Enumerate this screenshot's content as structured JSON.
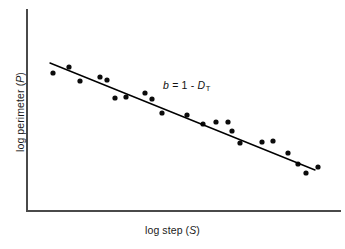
{
  "figure": {
    "background_color": "#ffffff",
    "axis_color": "#4a4a4a",
    "line_color": "#000000",
    "point_color": "#0c0c0c"
  },
  "labels": {
    "xaxis_prefix": "log step (",
    "xaxis_var": "S",
    "xaxis_suffix": ")",
    "yaxis_prefix": "log perimeter (",
    "yaxis_var": "P",
    "yaxis_suffix": ")",
    "annotation_var_b": "b",
    "annotation_eq": " = 1 - ",
    "annotation_var_d": "D",
    "annotation_sub": "T"
  },
  "chart_data": {
    "type": "scatter",
    "title": "",
    "xlabel": "log step (S)",
    "ylabel": "log perimeter (P)",
    "grid": false,
    "legend": false,
    "axis_ticks": [],
    "annotations": [
      {
        "text": "b = 1 - D_T",
        "x_px": 163,
        "y_px": 79,
        "meaning": "slope b equals one minus the topothesy/divider fractal dimension D sub T"
      }
    ],
    "axis_range_px": {
      "x_left": 27,
      "x_right": 340,
      "y_top": 10,
      "y_bottom": 211
    },
    "x": [
      53,
      69,
      80,
      100,
      107,
      115,
      126,
      145,
      152,
      162,
      187,
      203,
      216,
      228,
      232,
      240,
      262,
      273,
      288,
      298,
      306,
      318
    ],
    "y": [
      73,
      67,
      81,
      77,
      80,
      98,
      97,
      93,
      99,
      113,
      115,
      124,
      122,
      122,
      131,
      143,
      142,
      141,
      153,
      164,
      173,
      167
    ],
    "points": [
      {
        "x": 53,
        "y": 73
      },
      {
        "x": 69,
        "y": 67
      },
      {
        "x": 80,
        "y": 81
      },
      {
        "x": 100,
        "y": 77
      },
      {
        "x": 107,
        "y": 80
      },
      {
        "x": 115,
        "y": 98
      },
      {
        "x": 126,
        "y": 97
      },
      {
        "x": 145,
        "y": 93
      },
      {
        "x": 152,
        "y": 99
      },
      {
        "x": 162,
        "y": 113
      },
      {
        "x": 187,
        "y": 115
      },
      {
        "x": 203,
        "y": 124
      },
      {
        "x": 216,
        "y": 122
      },
      {
        "x": 228,
        "y": 122
      },
      {
        "x": 232,
        "y": 131
      },
      {
        "x": 240,
        "y": 143
      },
      {
        "x": 262,
        "y": 142
      },
      {
        "x": 273,
        "y": 141
      },
      {
        "x": 288,
        "y": 153
      },
      {
        "x": 298,
        "y": 164
      },
      {
        "x": 306,
        "y": 173
      },
      {
        "x": 318,
        "y": 167
      }
    ],
    "point_radius": 2.6,
    "fit_line": {
      "x1": 50,
      "y1": 63,
      "x2": 315,
      "y2": 170,
      "label": "b = 1 - D_T"
    }
  }
}
